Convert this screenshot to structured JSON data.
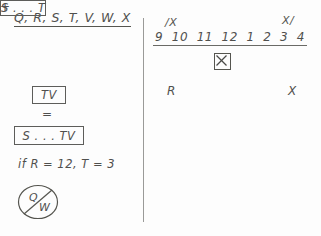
{
  "canvas": {
    "width": 321,
    "height": 236,
    "background_color": "#fdfdfd",
    "ink_color": "#50504e"
  },
  "left_panel": {
    "title": "Q, R, S, T, V, W, X",
    "equation": {
      "term_1": {
        "text": "S . . . T",
        "boxed": true
      },
      "operator_1": "+",
      "term_2": {
        "text": "TV",
        "boxed": true
      },
      "operator_2": "=",
      "result": {
        "text": "S . . . TV",
        "boxed": true
      }
    },
    "condition": "if R = 12, T = 3",
    "answer_mark": {
      "icon": "circled-slash-icon",
      "left_letter": "Q",
      "right_letter": "W"
    }
  },
  "right_panel": {
    "end_mark_left": "/X",
    "end_mark_right": "X/",
    "number_line": {
      "ticks": [
        "9",
        "10",
        "11",
        "12",
        "1",
        "2",
        "3",
        "4"
      ],
      "rule": true
    },
    "marker": {
      "icon": "boxed-x-icon",
      "label": "X",
      "position_between": [
        "12",
        "1"
      ]
    },
    "labels": {
      "left": "R",
      "right": "X"
    }
  }
}
